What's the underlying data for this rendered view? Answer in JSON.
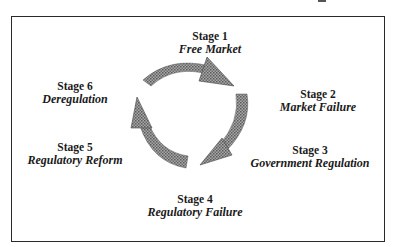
{
  "diagram": {
    "stages": [
      {
        "number": "Stage 1",
        "name": "Free Market"
      },
      {
        "number": "Stage 2",
        "name": "Market Failure"
      },
      {
        "number": "Stage 3",
        "name": "Government Regulation"
      },
      {
        "number": "Stage 4",
        "name": "Regulatory Failure"
      },
      {
        "number": "Stage 5",
        "name": "Regulatory Reform"
      },
      {
        "number": "Stage 6",
        "name": "Deregulation"
      }
    ],
    "arrow_color": "#8c8c8c"
  }
}
